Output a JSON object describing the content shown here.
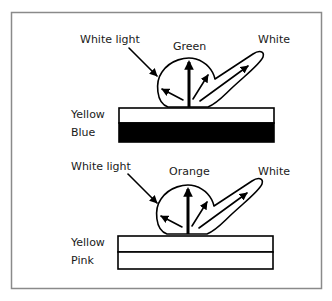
{
  "colors": {
    "frame": "#8a8a8a",
    "ink": "#000000",
    "background": "#ffffff"
  },
  "panels": [
    {
      "incident_label": "White light",
      "transmitted_color_label": "Green",
      "specular_label": "White",
      "layer_top_label": "Yellow",
      "layer_bottom_label": "Blue",
      "layer_bottom_fill": "#000000"
    },
    {
      "incident_label": "White light",
      "transmitted_color_label": "Orange",
      "specular_label": "White",
      "layer_top_label": "Yellow",
      "layer_bottom_label": "Pink",
      "layer_bottom_fill": "#ffffff"
    }
  ]
}
